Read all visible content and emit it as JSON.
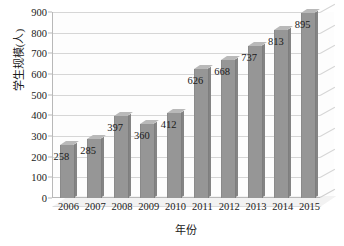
{
  "chart_data": {
    "type": "bar",
    "title": "",
    "xlabel": "年份",
    "ylabel": "学生规模(人)",
    "categories": [
      "2006",
      "2007",
      "2008",
      "2009",
      "2010",
      "2011",
      "2012",
      "2013",
      "2014",
      "2015"
    ],
    "values": [
      258,
      285,
      397,
      360,
      412,
      626,
      668,
      737,
      813,
      895
    ],
    "data_labels": [
      "258",
      "285",
      "397",
      "360",
      "412",
      "626",
      "668",
      "737",
      "813",
      "895"
    ],
    "ylim": [
      0,
      900
    ],
    "ytick_labels": [
      "0",
      "100",
      "200",
      "300",
      "400",
      "500",
      "600",
      "700",
      "800",
      "900"
    ],
    "ytick_values": [
      0,
      100,
      200,
      300,
      400,
      500,
      600,
      700,
      800,
      900
    ],
    "grid": true,
    "legend": false,
    "legend_position": "none",
    "series": [
      {
        "name": "学生规模(人)",
        "values": [
          258,
          285,
          397,
          360,
          412,
          626,
          668,
          737,
          813,
          895
        ]
      }
    ],
    "style": {
      "bar_color": "#969696",
      "bar_top_color": "#b9b9b9",
      "bar_side_color": "#848484",
      "gridline_color": "#d6d6d6",
      "axis_color": "#b8b8b8",
      "text_color": "#1a1a1a",
      "background": "#ffffff",
      "three_d": true
    }
  }
}
